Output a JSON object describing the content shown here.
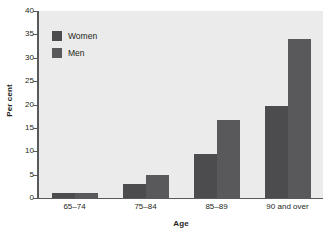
{
  "chart_data": {
    "type": "bar",
    "title": "",
    "xlabel": "Age",
    "ylabel": "Per cent",
    "categories": [
      "65–74",
      "75–84",
      "85–89",
      "90 and over"
    ],
    "series": [
      {
        "name": "Women",
        "values": [
          1,
          3,
          9.4,
          19.6
        ],
        "color": "#4c4c4e"
      },
      {
        "name": "Men",
        "values": [
          1,
          5,
          16.7,
          34
        ],
        "color": "#59595b"
      }
    ],
    "ylim": [
      0,
      40
    ],
    "ytick_values": [
      0,
      5,
      10,
      15,
      20,
      25,
      30,
      35,
      40
    ],
    "ytick_labels": [
      "0",
      "5",
      "10",
      "15",
      "20",
      "25",
      "30",
      "35",
      "40"
    ],
    "grid": false,
    "legend_position": "upper-left",
    "plot_background": "#ebebeb",
    "axis_color": "#58595b"
  }
}
